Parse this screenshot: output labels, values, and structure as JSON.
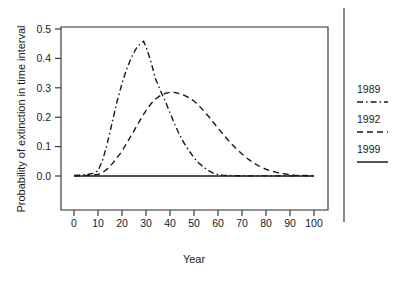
{
  "chart_data": {
    "type": "line",
    "title": "",
    "xlabel": "Year",
    "ylabel": "Probability of extinction in time interval",
    "xlim": [
      0,
      100
    ],
    "ylim": [
      0.0,
      0.5
    ],
    "grid": false,
    "legend_position": "right",
    "x_ticks": [
      0,
      10,
      20,
      30,
      40,
      50,
      60,
      70,
      80,
      90,
      100
    ],
    "x_tick_labels": [
      "0",
      "10",
      "20",
      "30",
      "40",
      "50",
      "60",
      "70",
      "80",
      "90",
      "100"
    ],
    "y_ticks": [
      0.0,
      0.1,
      0.2,
      0.3,
      0.4,
      0.5
    ],
    "y_tick_labels": [
      "0.0",
      "0.1",
      "0.2",
      "0.3",
      "0.4",
      "0.5"
    ],
    "x": [
      0,
      2,
      4,
      6,
      8,
      10,
      12,
      14,
      16,
      18,
      20,
      22,
      24,
      26,
      28,
      29,
      30,
      32,
      34,
      36,
      38,
      40,
      42,
      44,
      46,
      48,
      50,
      52,
      54,
      56,
      58,
      60,
      62,
      64,
      66,
      68,
      70,
      72,
      74,
      76,
      78,
      80,
      82,
      84,
      86,
      88,
      90,
      92,
      94,
      96,
      98,
      100
    ],
    "series": [
      {
        "name": "1989",
        "style": "dash-dot",
        "color": "#1a1a1a",
        "values": [
          0.002,
          0.003,
          0.004,
          0.006,
          0.009,
          0.018,
          0.055,
          0.115,
          0.185,
          0.255,
          0.315,
          0.365,
          0.405,
          0.435,
          0.453,
          0.458,
          0.44,
          0.39,
          0.33,
          0.29,
          0.255,
          0.215,
          0.175,
          0.14,
          0.11,
          0.085,
          0.062,
          0.044,
          0.03,
          0.018,
          0.01,
          0.005,
          0.003,
          0.002,
          0.001,
          0.001,
          0.001,
          0.0005,
          0.0005,
          0.0005,
          0.0005,
          0.0005,
          0.0005,
          0.0005,
          0.0005,
          0.0005,
          0.0005,
          0.0005,
          0.0005,
          0.0005,
          0.0005,
          0.0005
        ]
      },
      {
        "name": "1992",
        "style": "dashed",
        "color": "#1a1a1a",
        "values": [
          0.001,
          0.001,
          0.002,
          0.002,
          0.003,
          0.005,
          0.012,
          0.025,
          0.042,
          0.062,
          0.085,
          0.112,
          0.14,
          0.168,
          0.196,
          0.21,
          0.222,
          0.245,
          0.262,
          0.274,
          0.281,
          0.285,
          0.284,
          0.28,
          0.274,
          0.266,
          0.255,
          0.24,
          0.222,
          0.203,
          0.183,
          0.163,
          0.143,
          0.124,
          0.106,
          0.09,
          0.075,
          0.061,
          0.049,
          0.039,
          0.03,
          0.023,
          0.017,
          0.013,
          0.009,
          0.007,
          0.005,
          0.003,
          0.002,
          0.002,
          0.001,
          0.001
        ]
      },
      {
        "name": "1999",
        "style": "solid",
        "color": "#1a1a1a",
        "values": [
          0.0,
          0.0,
          0.0,
          0.0,
          0.0,
          0.0,
          0.0,
          0.0,
          0.0,
          0.0,
          0.0,
          0.0,
          0.0,
          0.0,
          0.0,
          0.0,
          0.0,
          0.0,
          0.0,
          0.0,
          0.0,
          0.0,
          0.0,
          0.0,
          0.0,
          0.0,
          0.0,
          0.0,
          0.0,
          0.0,
          0.0,
          0.0,
          0.0,
          0.0,
          0.0,
          0.0,
          0.0,
          0.0,
          0.0,
          0.0,
          0.0,
          0.0,
          0.0,
          0.0,
          0.0,
          0.0,
          0.0,
          0.0,
          0.0,
          0.0,
          0.0,
          0.0
        ]
      }
    ]
  },
  "legend": {
    "entries": [
      {
        "label": "1989",
        "style": "dash-dot"
      },
      {
        "label": "1992",
        "style": "dashed"
      },
      {
        "label": "1999",
        "style": "solid"
      }
    ]
  }
}
